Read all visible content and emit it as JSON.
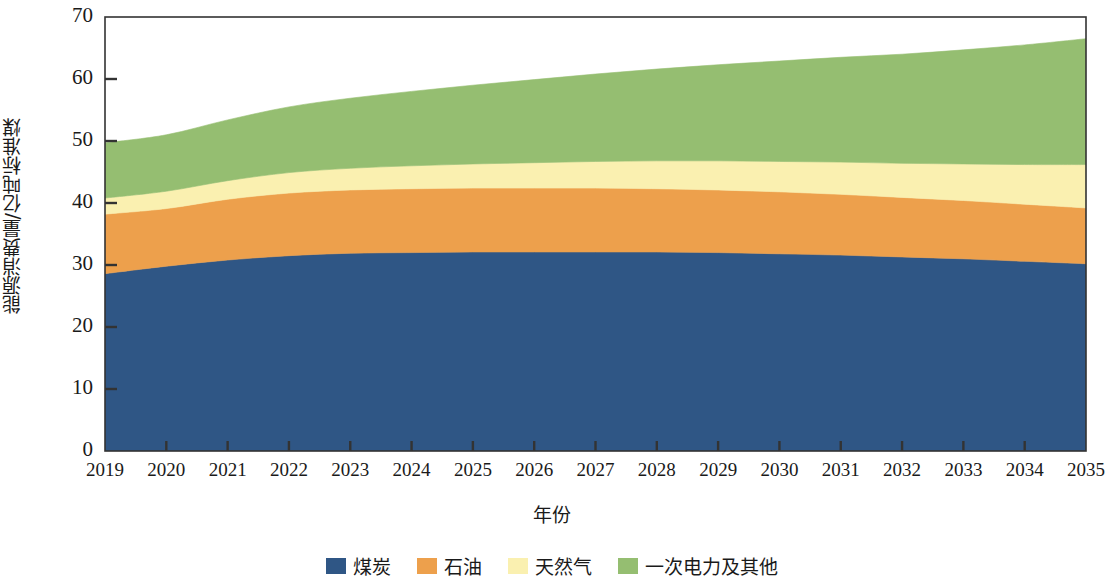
{
  "chart_data": {
    "type": "area",
    "stacked": true,
    "title": "",
    "xlabel": "年份",
    "ylabel": "能源消费量/亿吨标准煤",
    "categories": [
      2019,
      2020,
      2021,
      2022,
      2023,
      2024,
      2025,
      2026,
      2027,
      2028,
      2029,
      2030,
      2031,
      2032,
      2033,
      2034,
      2035
    ],
    "xtick_labels": [
      "2019",
      "2020",
      "2021",
      "2022",
      "2023",
      "2024",
      "2025",
      "2026",
      "2027",
      "2028",
      "2029",
      "2030",
      "2031",
      "2032",
      "2033",
      "2034",
      "2035"
    ],
    "ytick_labels": [
      "0",
      "10",
      "20",
      "30",
      "40",
      "50",
      "60",
      "70"
    ],
    "ylim": [
      0,
      70
    ],
    "ytick_step": 10,
    "grid": false,
    "legend_position": "bottom",
    "series": [
      {
        "name": "煤炭",
        "color": "#2f5685",
        "values": [
          28.6,
          29.8,
          30.8,
          31.5,
          31.9,
          32.0,
          32.1,
          32.1,
          32.1,
          32.1,
          32.0,
          31.8,
          31.6,
          31.3,
          31.0,
          30.6,
          30.2
        ]
      },
      {
        "name": "石油",
        "color": "#eda04c",
        "values": [
          9.6,
          9.3,
          9.8,
          10.1,
          10.2,
          10.3,
          10.3,
          10.3,
          10.3,
          10.2,
          10.1,
          10.0,
          9.8,
          9.6,
          9.4,
          9.2,
          9.0
        ]
      },
      {
        "name": "天然气",
        "color": "#faf0b0",
        "values": [
          2.6,
          2.8,
          3.0,
          3.3,
          3.5,
          3.7,
          3.9,
          4.1,
          4.3,
          4.5,
          4.7,
          4.9,
          5.2,
          5.5,
          5.9,
          6.4,
          7.0
        ]
      },
      {
        "name": "一次电力及其他",
        "color": "#95be71",
        "values": [
          8.9,
          9.1,
          9.8,
          10.6,
          11.3,
          12.0,
          12.7,
          13.4,
          14.1,
          14.8,
          15.5,
          16.2,
          16.9,
          17.6,
          18.4,
          19.3,
          20.3
        ]
      }
    ],
    "totals": [
      49.7,
      51.0,
      53.4,
      55.5,
      56.9,
      58.0,
      59.0,
      59.9,
      60.8,
      61.6,
      62.3,
      62.9,
      63.5,
      64.0,
      64.7,
      65.5,
      66.5
    ]
  },
  "axis": {
    "y_title": "能源消费量/亿吨标准煤",
    "x_title": "年份"
  },
  "legend": {
    "items": [
      {
        "label": "煤炭",
        "color": "#2f5685"
      },
      {
        "label": "石油",
        "color": "#eda04c"
      },
      {
        "label": "天然气",
        "color": "#faf0b0"
      },
      {
        "label": "一次电力及其他",
        "color": "#95be71"
      }
    ]
  },
  "frame": {
    "axis_color": "#333333"
  }
}
